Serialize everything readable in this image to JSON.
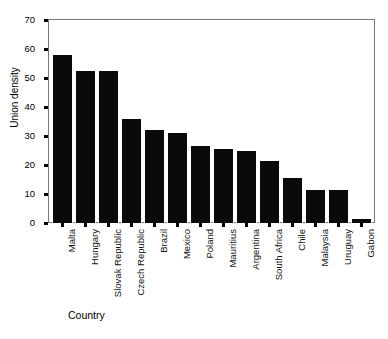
{
  "chart_data": {
    "type": "bar",
    "title": "",
    "xlabel": "Country",
    "ylabel": "Union density",
    "categories": [
      "Malta",
      "Hungary",
      "Slovak Republic",
      "Czech Republic",
      "Brazil",
      "Mexico",
      "Poland",
      "Mauritius",
      "Argentina",
      "South Africa",
      "Chile",
      "Malaysia",
      "Uruguay",
      "Gabon"
    ],
    "values": [
      58,
      52.3,
      52.3,
      36,
      32,
      31,
      26.5,
      25.5,
      25,
      21.5,
      15.5,
      11.5,
      11.3,
      1.5
    ],
    "ylim": [
      0,
      70
    ],
    "yticks": [
      0,
      10,
      20,
      30,
      40,
      50,
      60,
      70
    ],
    "ytick_labels": [
      "0",
      "10",
      "20",
      "30",
      "40",
      "50",
      "60",
      "70"
    ],
    "grid": false,
    "legend": "none",
    "bar_color": "#0a0a0a",
    "frame_color": "#777777",
    "background": "#ffffff"
  }
}
